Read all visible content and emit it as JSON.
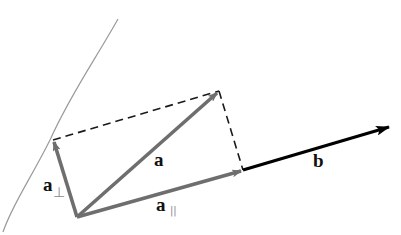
{
  "diagram": {
    "labels": {
      "a": "a",
      "b": "b",
      "a_perp_base": "a",
      "a_perp_sub": "⊥",
      "a_par_base": "a",
      "a_par_sub": "||"
    },
    "colors": {
      "vector_gray": "#6e6e6e",
      "vector_b": "#000000",
      "dashed": "#1a1a1a",
      "curve": "#9a9a9a",
      "background": "#ffffff"
    },
    "points": {
      "origin": [
        77,
        217
      ],
      "a_tip": [
        219,
        91
      ],
      "a_perp_tip": [
        53,
        140
      ],
      "a_par_tip": [
        243,
        170
      ],
      "b_tip": [
        389,
        127
      ]
    }
  }
}
